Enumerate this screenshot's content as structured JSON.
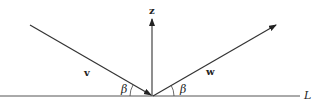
{
  "diagram": {
    "labels": {
      "z": "z",
      "v": "v",
      "w": "w",
      "beta_left": "β",
      "beta_right": "β",
      "line": "L"
    },
    "colors": {
      "stroke": "#333333",
      "background": "#ffffff"
    }
  }
}
